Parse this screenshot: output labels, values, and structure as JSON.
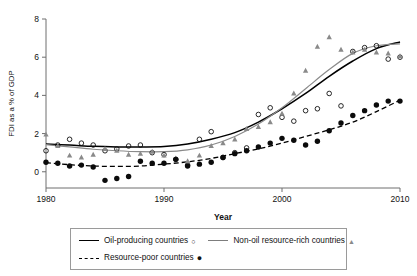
{
  "chart_data": {
    "type": "scatter",
    "title": "",
    "xlabel": "Year",
    "ylabel": "FDI as a % of GDP",
    "xlim": [
      1980,
      2010
    ],
    "ylim": [
      -0.85,
      8
    ],
    "xticks": [
      1980,
      1990,
      2000,
      2010
    ],
    "yticks": [
      0,
      2,
      4,
      6,
      8
    ],
    "xtick_labels": [
      "1980",
      "1990",
      "2000",
      "2010"
    ],
    "ytick_labels": [
      "0",
      "2",
      "4",
      "6",
      "8"
    ],
    "grid": false,
    "legend_position": "below",
    "x": [
      1980,
      1981,
      1982,
      1983,
      1984,
      1985,
      1986,
      1987,
      1988,
      1989,
      1990,
      1991,
      1992,
      1993,
      1994,
      1995,
      1996,
      1997,
      1998,
      1999,
      2000,
      2001,
      2002,
      2003,
      2004,
      2005,
      2006,
      2007,
      2008,
      2009,
      2010
    ],
    "series": [
      {
        "name": "Oil-producing countries",
        "marker": "open-circle",
        "color": "#111111",
        "fit_line": "solid-black",
        "values": [
          1.1,
          1.4,
          1.7,
          1.5,
          1.4,
          1.1,
          1.2,
          1.35,
          1.4,
          1.0,
          0.9,
          0.65,
          0.35,
          1.7,
          2.1,
          0.75,
          1.0,
          1.25,
          3.0,
          3.35,
          2.85,
          2.65,
          3.2,
          3.3,
          4.1,
          3.45,
          6.3,
          6.5,
          6.6,
          5.9,
          6.0
        ]
      },
      {
        "name": "Non-oil resource-rich countries",
        "marker": "triangle",
        "color": "#8a8a8a",
        "fit_line": "solid-gray",
        "values": [
          1.95,
          1.35,
          0.85,
          0.75,
          0.9,
          1.2,
          1.1,
          0.9,
          0.95,
          1.05,
          0.85,
          0.7,
          0.55,
          0.85,
          1.35,
          1.5,
          1.7,
          2.25,
          2.35,
          2.6,
          3.05,
          4.1,
          5.3,
          6.55,
          7.05,
          6.4,
          6.25,
          6.4,
          6.25,
          6.2,
          6.05
        ]
      },
      {
        "name": "Resource-poor countries",
        "marker": "filled-circle",
        "color": "#0b0b0b",
        "fit_line": "dashed-black",
        "values": [
          0.5,
          0.45,
          0.3,
          0.35,
          0.25,
          -0.45,
          -0.35,
          -0.25,
          0.55,
          0.45,
          0.45,
          0.65,
          0.3,
          0.4,
          0.5,
          0.75,
          0.95,
          1.1,
          1.3,
          1.5,
          1.75,
          1.65,
          1.4,
          1.6,
          2.15,
          2.55,
          2.95,
          3.2,
          3.5,
          3.7,
          3.7
        ]
      }
    ],
    "fit_curves": [
      {
        "name": "Oil-producing countries",
        "style": "solid-black",
        "points": [
          [
            1980,
            1.45
          ],
          [
            1982,
            1.4
          ],
          [
            1984,
            1.33
          ],
          [
            1986,
            1.3
          ],
          [
            1988,
            1.3
          ],
          [
            1990,
            1.32
          ],
          [
            1992,
            1.45
          ],
          [
            1994,
            1.7
          ],
          [
            1996,
            2.05
          ],
          [
            1998,
            2.6
          ],
          [
            2000,
            3.3
          ],
          [
            2002,
            4.1
          ],
          [
            2004,
            5.0
          ],
          [
            2006,
            5.8
          ],
          [
            2008,
            6.45
          ],
          [
            2010,
            6.8
          ]
        ]
      },
      {
        "name": "Non-oil resource-rich countries",
        "style": "solid-gray",
        "points": [
          [
            1980,
            1.42
          ],
          [
            1982,
            1.3
          ],
          [
            1984,
            1.18
          ],
          [
            1986,
            1.1
          ],
          [
            1988,
            1.05
          ],
          [
            1990,
            1.05
          ],
          [
            1992,
            1.15
          ],
          [
            1994,
            1.4
          ],
          [
            1996,
            1.85
          ],
          [
            1998,
            2.5
          ],
          [
            2000,
            3.35
          ],
          [
            2002,
            4.35
          ],
          [
            2004,
            5.35
          ],
          [
            2006,
            6.2
          ],
          [
            2008,
            6.6
          ],
          [
            2010,
            6.7
          ]
        ]
      },
      {
        "name": "Resource-poor countries",
        "style": "dashed-black",
        "points": [
          [
            1980,
            0.48
          ],
          [
            1982,
            0.37
          ],
          [
            1984,
            0.3
          ],
          [
            1986,
            0.28
          ],
          [
            1988,
            0.3
          ],
          [
            1990,
            0.4
          ],
          [
            1992,
            0.52
          ],
          [
            1994,
            0.7
          ],
          [
            1996,
            0.95
          ],
          [
            1998,
            1.2
          ],
          [
            2000,
            1.5
          ],
          [
            2002,
            1.85
          ],
          [
            2004,
            2.2
          ],
          [
            2006,
            2.6
          ],
          [
            2008,
            3.15
          ],
          [
            2010,
            3.75
          ]
        ]
      }
    ]
  },
  "axes": {
    "y_title": "FDI as a % of GDP",
    "x_title": "Year",
    "x_tick_labels": [
      "1980",
      "1990",
      "2000",
      "2010"
    ],
    "y_tick_labels": [
      "8",
      "6",
      "4",
      "2",
      "0"
    ]
  },
  "legend": {
    "rows": [
      [
        {
          "label": "Oil-producing countries",
          "marker": "○",
          "line": "solid-dark"
        },
        {
          "label": "Non-oil resource-rich countries",
          "marker": "▲",
          "line": "solid-gray"
        }
      ],
      [
        {
          "label": "Resource-poor countries",
          "marker": "●",
          "line": "dashed-dark"
        }
      ]
    ]
  }
}
